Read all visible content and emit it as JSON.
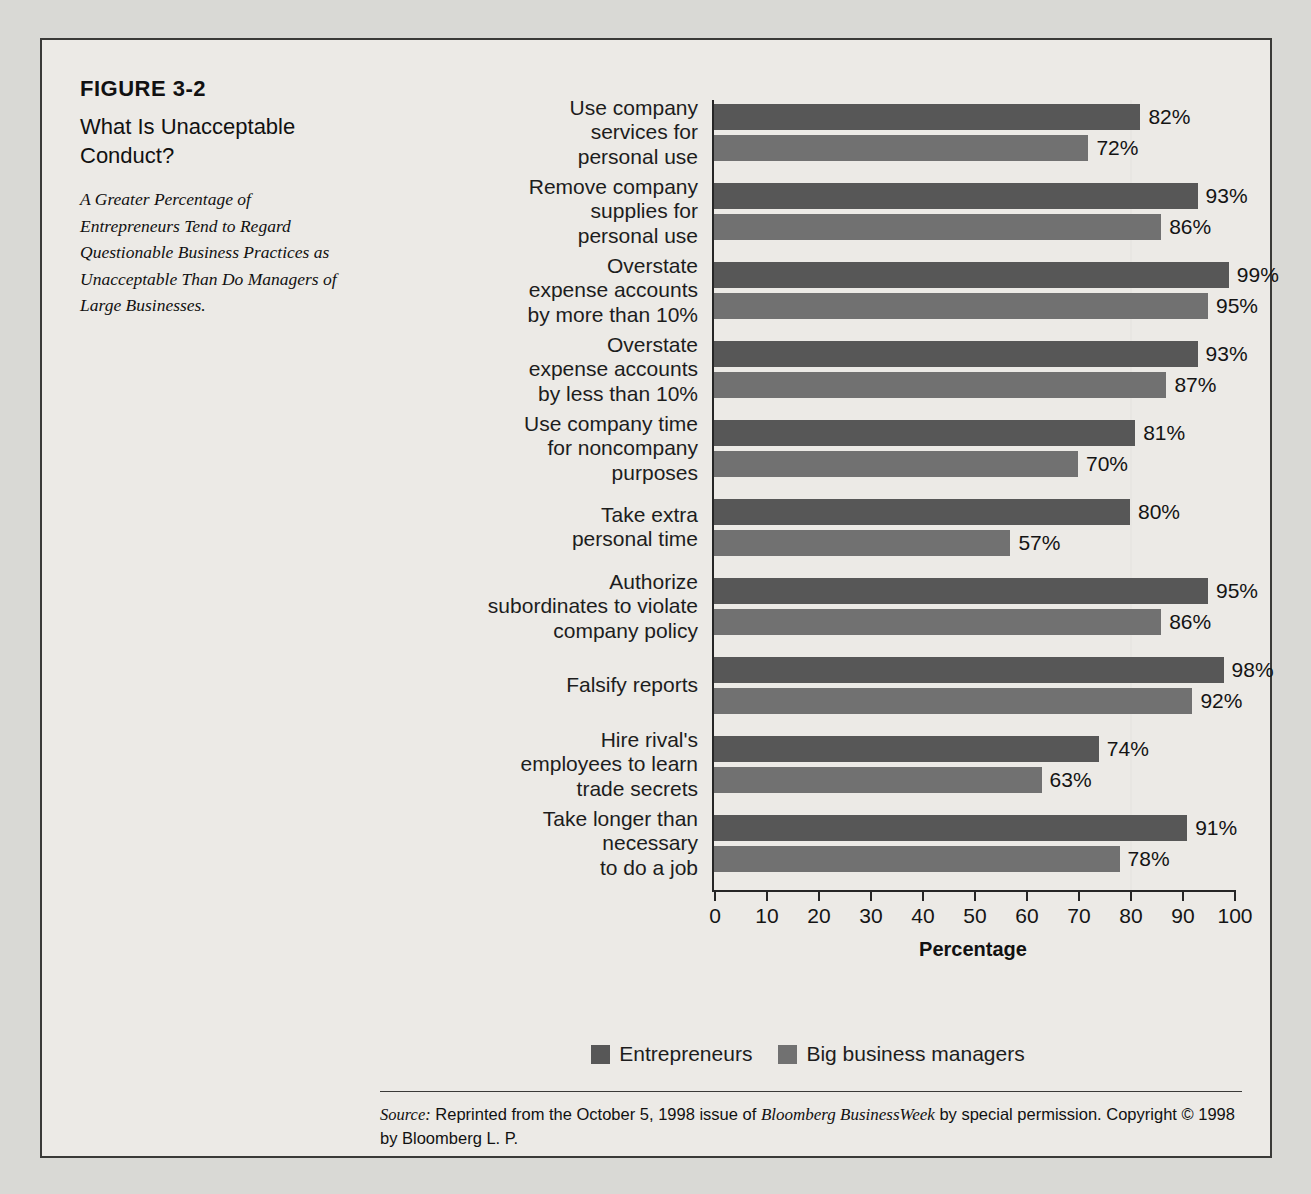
{
  "figure": {
    "number": "FIGURE 3-2",
    "title": "What Is Unacceptable Conduct?",
    "subtitle": "A Greater Percentage of Entrepreneurs Tend to Regard Questionable Business Practices as Unacceptable Than Do Managers of Large Businesses."
  },
  "source": {
    "label": "Source:",
    "text_before": " Reprinted from the October 5, 1998 issue of ",
    "publication": "Bloomberg BusinessWeek",
    "text_after": " by special permission. Copyright © 1998 by Bloomberg L. P."
  },
  "colors": {
    "entrepreneurs": "#575757",
    "big_business_managers": "#717171",
    "frame": "#3a3a38",
    "page_background": "#d9d9d5",
    "figure_background": "#eceae6"
  },
  "chart_data": {
    "type": "bar",
    "orientation": "horizontal",
    "title": "What Is Unacceptable Conduct?",
    "xlabel": "Percentage",
    "ylabel": "",
    "xlim": [
      0,
      100
    ],
    "xticks": [
      0,
      10,
      20,
      30,
      40,
      50,
      60,
      70,
      80,
      90,
      100
    ],
    "grid": true,
    "gridlines_at": [
      80
    ],
    "legend_position": "bottom",
    "value_suffix": "%",
    "categories": [
      "Use company services for personal use",
      "Remove company supplies for personal use",
      "Overstate expense accounts by more than 10%",
      "Overstate expense accounts by less than 10%",
      "Use company time for noncompany purposes",
      "Take extra personal time",
      "Authorize subordinates to violate company policy",
      "Falsify reports",
      "Hire rival's employees to learn trade secrets",
      "Take longer than necessary to do a job"
    ],
    "category_lines": [
      [
        "Use company",
        "services for",
        "personal use"
      ],
      [
        "Remove company",
        "supplies for",
        "personal use"
      ],
      [
        "Overstate",
        "expense accounts",
        "by more than 10%"
      ],
      [
        "Overstate",
        "expense accounts",
        "by less than 10%"
      ],
      [
        "Use company time",
        "for noncompany",
        "purposes"
      ],
      [
        "Take extra",
        "personal time"
      ],
      [
        "Authorize",
        "subordinates to violate",
        "company policy"
      ],
      [
        "Falsify reports"
      ],
      [
        "Hire rival's",
        "employees to learn",
        "trade secrets"
      ],
      [
        "Take longer than",
        "necessary",
        "to do a job"
      ]
    ],
    "series": [
      {
        "name": "Entrepreneurs",
        "color": "#575757",
        "values": [
          82,
          93,
          99,
          93,
          81,
          80,
          95,
          98,
          74,
          91
        ],
        "labels": [
          "82%",
          "93%",
          "99%",
          "93%",
          "81%",
          "80%",
          "95%",
          "98%",
          "74%",
          "91%"
        ]
      },
      {
        "name": "Big business managers",
        "color": "#717171",
        "values": [
          72,
          86,
          95,
          87,
          70,
          57,
          86,
          92,
          63,
          78
        ],
        "labels": [
          "72%",
          "86%",
          "95%",
          "87%",
          "70%",
          "57%",
          "86%",
          "92%",
          "63%",
          "78%"
        ]
      }
    ]
  }
}
